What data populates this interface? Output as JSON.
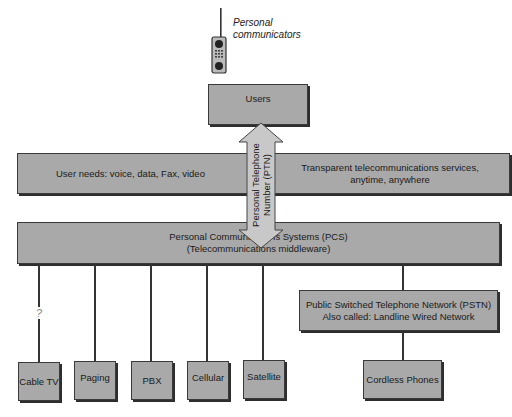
{
  "diagram": {
    "personal_communicators": {
      "label": "Personal\ncommunicators",
      "icon": "mobile-phone-icon"
    },
    "users": {
      "label": "Users"
    },
    "user_needs": {
      "label": "User needs:  voice, data, Fax, video"
    },
    "transparent_services": {
      "label": "Transparent telecommunications services,\nanytime, anywhere"
    },
    "ptn_arrow": {
      "label": "Personal Telephone\nNumber (PTN)"
    },
    "pcs": {
      "label": "Personal Communications Systems (PCS)\n(Telecommunications middleware)"
    },
    "unknown_link_marker": "?",
    "endpoints": [
      {
        "label": "Cable TV"
      },
      {
        "label": "Paging"
      },
      {
        "label": "PBX"
      },
      {
        "label": "Cellular"
      },
      {
        "label": "Satellite"
      }
    ],
    "pstn": {
      "label": "Public Switched Telephone Network (PSTN)\nAlso called:  Landline Wired Network"
    },
    "cordless_phones": {
      "label": "Cordless Phones"
    },
    "colors": {
      "box_fill": "#a9a9a9",
      "arrow_fill": "#c8c8c8",
      "border": "#3a3a3a"
    }
  }
}
